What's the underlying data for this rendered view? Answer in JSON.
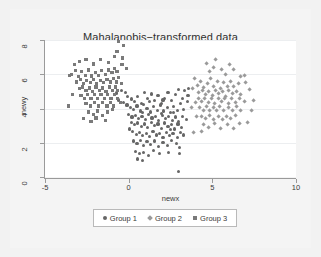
{
  "chart_data": {
    "type": "scatter",
    "title": "Mahalanobis−transformed data",
    "xlabel": "newx",
    "ylabel": "newy",
    "xlim": [
      -5,
      10
    ],
    "ylim": [
      0,
      8
    ],
    "xticks": [
      "-5",
      "0",
      "5",
      "10"
    ],
    "xtick_values": [
      -5,
      0,
      5,
      10
    ],
    "yticks": [
      "0",
      "2",
      "4",
      "6",
      "8"
    ],
    "ytick_values": [
      0,
      2,
      4,
      6,
      8
    ],
    "grid": "horizontal",
    "legend_position": "bottom",
    "colors": {
      "group1": "#666666",
      "group2": "#9a9a9a",
      "group3": "#7a7a7a",
      "panel": "#ffffff",
      "figure": "#f2f2f2",
      "axis": "#9a9a9a",
      "gridline": "#eceef0",
      "text": "#3a3a39"
    },
    "series": [
      {
        "name": "Group 1",
        "marker": "circle",
        "color": "#666666",
        "points": [
          [
            -0.45,
            5.05
          ],
          [
            -0.2,
            4.95
          ],
          [
            -0.05,
            4.7
          ],
          [
            0.15,
            4.55
          ],
          [
            0.35,
            4.4
          ],
          [
            0.55,
            4.7
          ],
          [
            0.75,
            4.3
          ],
          [
            0.95,
            4.95
          ],
          [
            1.15,
            4.6
          ],
          [
            1.35,
            4.85
          ],
          [
            1.55,
            4.45
          ],
          [
            1.75,
            4.75
          ],
          [
            1.95,
            4.3
          ],
          [
            2.15,
            4.6
          ],
          [
            2.35,
            4.95
          ],
          [
            2.55,
            4.45
          ],
          [
            2.8,
            4.8
          ],
          [
            3.0,
            5.1
          ],
          [
            3.2,
            4.6
          ],
          [
            3.35,
            5.05
          ],
          [
            -0.3,
            4.35
          ],
          [
            -0.1,
            4.2
          ],
          [
            0.1,
            4.05
          ],
          [
            0.3,
            3.95
          ],
          [
            0.5,
            4.15
          ],
          [
            0.7,
            3.85
          ],
          [
            0.9,
            4.25
          ],
          [
            1.1,
            4.0
          ],
          [
            1.3,
            3.8
          ],
          [
            1.5,
            4.1
          ],
          [
            1.7,
            3.9
          ],
          [
            1.9,
            4.2
          ],
          [
            2.1,
            3.85
          ],
          [
            2.3,
            4.05
          ],
          [
            2.5,
            3.75
          ],
          [
            2.7,
            4.1
          ],
          [
            2.9,
            3.9
          ],
          [
            3.1,
            4.3
          ],
          [
            3.3,
            3.95
          ],
          [
            3.5,
            4.4
          ],
          [
            0.0,
            3.65
          ],
          [
            0.2,
            3.5
          ],
          [
            0.4,
            3.6
          ],
          [
            0.6,
            3.4
          ],
          [
            0.8,
            3.55
          ],
          [
            1.0,
            3.35
          ],
          [
            1.2,
            3.65
          ],
          [
            1.4,
            3.45
          ],
          [
            1.6,
            3.55
          ],
          [
            1.8,
            3.3
          ],
          [
            2.0,
            3.6
          ],
          [
            2.2,
            3.4
          ],
          [
            2.4,
            3.55
          ],
          [
            2.6,
            3.3
          ],
          [
            2.8,
            3.5
          ],
          [
            3.0,
            3.25
          ],
          [
            3.2,
            3.55
          ],
          [
            3.45,
            3.35
          ],
          [
            0.15,
            3.2
          ],
          [
            0.35,
            3.05
          ],
          [
            0.55,
            3.15
          ],
          [
            0.75,
            2.95
          ],
          [
            0.95,
            3.1
          ],
          [
            1.15,
            2.9
          ],
          [
            1.35,
            3.2
          ],
          [
            1.55,
            3.0
          ],
          [
            1.75,
            3.1
          ],
          [
            1.95,
            2.85
          ],
          [
            2.15,
            3.15
          ],
          [
            2.35,
            2.95
          ],
          [
            2.55,
            3.05
          ],
          [
            2.75,
            2.8
          ],
          [
            2.95,
            3.1
          ],
          [
            3.15,
            2.9
          ],
          [
            0.25,
            2.65
          ],
          [
            0.45,
            2.5
          ],
          [
            0.65,
            2.6
          ],
          [
            0.85,
            2.4
          ],
          [
            1.05,
            2.55
          ],
          [
            1.25,
            2.35
          ],
          [
            1.45,
            2.65
          ],
          [
            1.65,
            2.45
          ],
          [
            1.85,
            2.55
          ],
          [
            2.05,
            2.3
          ],
          [
            2.25,
            2.6
          ],
          [
            2.45,
            2.4
          ],
          [
            2.65,
            2.55
          ],
          [
            2.9,
            2.3
          ],
          [
            3.1,
            2.6
          ],
          [
            3.3,
            2.45
          ],
          [
            0.3,
            2.1
          ],
          [
            0.5,
            1.95
          ],
          [
            0.7,
            2.15
          ],
          [
            0.9,
            1.85
          ],
          [
            1.1,
            2.05
          ],
          [
            1.3,
            1.9
          ],
          [
            1.55,
            2.1
          ],
          [
            1.8,
            1.8
          ],
          [
            2.05,
            2.0
          ],
          [
            2.3,
            1.85
          ],
          [
            2.55,
            2.15
          ],
          [
            2.85,
            1.95
          ],
          [
            3.05,
            1.7
          ],
          [
            0.4,
            1.5
          ],
          [
            0.65,
            1.35
          ],
          [
            0.9,
            1.45
          ],
          [
            1.2,
            1.25
          ],
          [
            1.5,
            1.55
          ],
          [
            1.85,
            1.35
          ],
          [
            2.4,
            1.45
          ],
          [
            3.05,
            1.35
          ],
          [
            0.55,
            1.05
          ],
          [
            0.85,
            0.95
          ],
          [
            3.0,
            0.3
          ],
          [
            -0.6,
            4.5
          ],
          [
            -0.75,
            4.9
          ],
          [
            3.55,
            4.75
          ],
          [
            3.6,
            5.15
          ],
          [
            0.05,
            2.8
          ],
          [
            2.7,
            3.75
          ],
          [
            1.25,
            4.4
          ],
          [
            2.05,
            4.5
          ],
          [
            0.85,
            3.75
          ],
          [
            1.95,
            3.7
          ],
          [
            2.5,
            2.75
          ]
        ]
      },
      {
        "name": "Group 2",
        "marker": "diamond",
        "color": "#9a9a9a",
        "points": [
          [
            4.1,
            5.35
          ],
          [
            4.3,
            5.6
          ],
          [
            4.5,
            5.2
          ],
          [
            4.7,
            5.45
          ],
          [
            4.9,
            5.75
          ],
          [
            5.1,
            5.3
          ],
          [
            5.3,
            5.55
          ],
          [
            5.5,
            5.15
          ],
          [
            5.7,
            5.5
          ],
          [
            5.9,
            5.3
          ],
          [
            6.1,
            5.6
          ],
          [
            6.3,
            5.25
          ],
          [
            6.55,
            5.45
          ],
          [
            4.2,
            4.95
          ],
          [
            4.4,
            5.05
          ],
          [
            4.6,
            4.8
          ],
          [
            4.8,
            5.0
          ],
          [
            5.0,
            4.75
          ],
          [
            5.2,
            5.05
          ],
          [
            5.4,
            4.85
          ],
          [
            5.6,
            5.0
          ],
          [
            5.8,
            4.7
          ],
          [
            6.0,
            5.05
          ],
          [
            6.2,
            4.85
          ],
          [
            6.45,
            5.0
          ],
          [
            6.7,
            4.8
          ],
          [
            4.15,
            4.55
          ],
          [
            4.35,
            4.4
          ],
          [
            4.55,
            4.6
          ],
          [
            4.75,
            4.35
          ],
          [
            4.95,
            4.55
          ],
          [
            5.15,
            4.3
          ],
          [
            5.35,
            4.6
          ],
          [
            5.55,
            4.4
          ],
          [
            5.75,
            4.55
          ],
          [
            5.95,
            4.3
          ],
          [
            6.15,
            4.55
          ],
          [
            6.4,
            4.35
          ],
          [
            6.65,
            4.6
          ],
          [
            6.9,
            4.4
          ],
          [
            4.25,
            4.05
          ],
          [
            4.45,
            3.9
          ],
          [
            4.65,
            4.1
          ],
          [
            4.85,
            3.85
          ],
          [
            5.05,
            4.05
          ],
          [
            5.25,
            3.9
          ],
          [
            5.45,
            4.1
          ],
          [
            5.7,
            3.85
          ],
          [
            5.95,
            4.05
          ],
          [
            6.2,
            3.9
          ],
          [
            6.45,
            4.1
          ],
          [
            6.7,
            3.85
          ],
          [
            4.35,
            3.55
          ],
          [
            4.6,
            3.4
          ],
          [
            4.85,
            3.6
          ],
          [
            5.1,
            3.35
          ],
          [
            5.35,
            3.55
          ],
          [
            5.6,
            3.35
          ],
          [
            5.85,
            3.55
          ],
          [
            6.1,
            3.4
          ],
          [
            6.4,
            3.6
          ],
          [
            4.5,
            3.05
          ],
          [
            4.8,
            2.9
          ],
          [
            5.15,
            3.1
          ],
          [
            5.5,
            2.85
          ],
          [
            5.9,
            3.05
          ],
          [
            6.25,
            2.85
          ],
          [
            6.6,
            3.1
          ],
          [
            3.95,
            5.75
          ],
          [
            3.85,
            5.15
          ],
          [
            4.0,
            4.35
          ],
          [
            3.75,
            4.05
          ],
          [
            4.05,
            3.5
          ],
          [
            4.35,
            2.65
          ],
          [
            5.05,
            6.4
          ],
          [
            5.2,
            6.85
          ],
          [
            4.85,
            6.15
          ],
          [
            5.55,
            6.3
          ],
          [
            5.8,
            6.0
          ],
          [
            6.3,
            6.25
          ],
          [
            6.7,
            5.85
          ],
          [
            7.0,
            5.5
          ],
          [
            7.25,
            5.1
          ],
          [
            7.45,
            4.45
          ],
          [
            7.35,
            3.85
          ],
          [
            7.1,
            3.15
          ],
          [
            6.95,
            5.95
          ],
          [
            4.65,
            6.6
          ],
          [
            6.05,
            6.55
          ],
          [
            3.9,
            2.6
          ]
        ]
      },
      {
        "name": "Group 3",
        "marker": "square",
        "color": "#7a7a7a",
        "points": [
          [
            -3.4,
            6.0
          ],
          [
            -3.2,
            6.2
          ],
          [
            -3.0,
            5.85
          ],
          [
            -2.8,
            6.15
          ],
          [
            -2.6,
            5.95
          ],
          [
            -2.4,
            6.25
          ],
          [
            -2.2,
            5.9
          ],
          [
            -2.0,
            6.1
          ],
          [
            -1.8,
            5.95
          ],
          [
            -1.6,
            6.2
          ],
          [
            -1.4,
            6.0
          ],
          [
            -1.2,
            6.25
          ],
          [
            -1.0,
            6.1
          ],
          [
            -0.85,
            6.35
          ],
          [
            -0.7,
            6.15
          ],
          [
            -3.1,
            5.55
          ],
          [
            -2.9,
            5.7
          ],
          [
            -2.7,
            5.45
          ],
          [
            -2.5,
            5.65
          ],
          [
            -2.3,
            5.5
          ],
          [
            -2.1,
            5.7
          ],
          [
            -1.9,
            5.45
          ],
          [
            -1.7,
            5.65
          ],
          [
            -1.5,
            5.5
          ],
          [
            -1.3,
            5.7
          ],
          [
            -1.1,
            5.55
          ],
          [
            -0.9,
            5.75
          ],
          [
            -0.75,
            5.55
          ],
          [
            -0.6,
            5.8
          ],
          [
            -2.95,
            5.15
          ],
          [
            -2.75,
            5.25
          ],
          [
            -2.55,
            5.05
          ],
          [
            -2.35,
            5.2
          ],
          [
            -2.15,
            5.0
          ],
          [
            -1.95,
            5.25
          ],
          [
            -1.75,
            5.05
          ],
          [
            -1.55,
            5.2
          ],
          [
            -1.35,
            5.0
          ],
          [
            -1.15,
            5.25
          ],
          [
            -0.95,
            5.05
          ],
          [
            -0.8,
            5.25
          ],
          [
            -0.65,
            5.05
          ],
          [
            -2.85,
            4.75
          ],
          [
            -2.65,
            4.6
          ],
          [
            -2.45,
            4.8
          ],
          [
            -2.25,
            4.6
          ],
          [
            -2.05,
            4.8
          ],
          [
            -1.85,
            4.6
          ],
          [
            -1.65,
            4.8
          ],
          [
            -1.45,
            4.6
          ],
          [
            -1.25,
            4.8
          ],
          [
            -1.05,
            4.6
          ],
          [
            -0.85,
            4.8
          ],
          [
            -0.65,
            4.6
          ],
          [
            -2.55,
            4.3
          ],
          [
            -2.3,
            4.15
          ],
          [
            -2.05,
            4.35
          ],
          [
            -1.8,
            4.15
          ],
          [
            -1.55,
            4.35
          ],
          [
            -1.3,
            4.15
          ],
          [
            -1.1,
            4.35
          ],
          [
            -0.9,
            4.15
          ],
          [
            -2.4,
            3.8
          ],
          [
            -2.1,
            3.65
          ],
          [
            -1.85,
            3.85
          ],
          [
            -1.55,
            3.6
          ],
          [
            -1.25,
            3.8
          ],
          [
            -3.6,
            4.15
          ],
          [
            -3.35,
            4.8
          ],
          [
            -3.55,
            5.95
          ],
          [
            -3.25,
            6.55
          ],
          [
            -2.95,
            6.75
          ],
          [
            -2.55,
            6.85
          ],
          [
            -2.1,
            6.6
          ],
          [
            -1.7,
            6.85
          ],
          [
            -1.2,
            6.7
          ],
          [
            -0.85,
            7.05
          ],
          [
            -0.7,
            7.35
          ],
          [
            -0.6,
            7.9
          ],
          [
            -0.3,
            7.7
          ],
          [
            -0.35,
            6.95
          ],
          [
            -0.15,
            6.35
          ],
          [
            -0.4,
            6.55
          ],
          [
            -2.7,
            3.4
          ],
          [
            -2.25,
            3.25
          ],
          [
            -1.95,
            3.45
          ],
          [
            -1.4,
            3.3
          ],
          [
            -0.95,
            3.95
          ],
          [
            -0.5,
            4.35
          ],
          [
            -0.45,
            5.45
          ]
        ]
      }
    ]
  },
  "legend": {
    "entries": [
      {
        "label": "Group 1",
        "marker": "circle",
        "color": "#666666"
      },
      {
        "label": "Group 2",
        "marker": "diamond",
        "color": "#9a9a9a"
      },
      {
        "label": "Group 3",
        "marker": "square",
        "color": "#7a7a7a"
      }
    ]
  }
}
